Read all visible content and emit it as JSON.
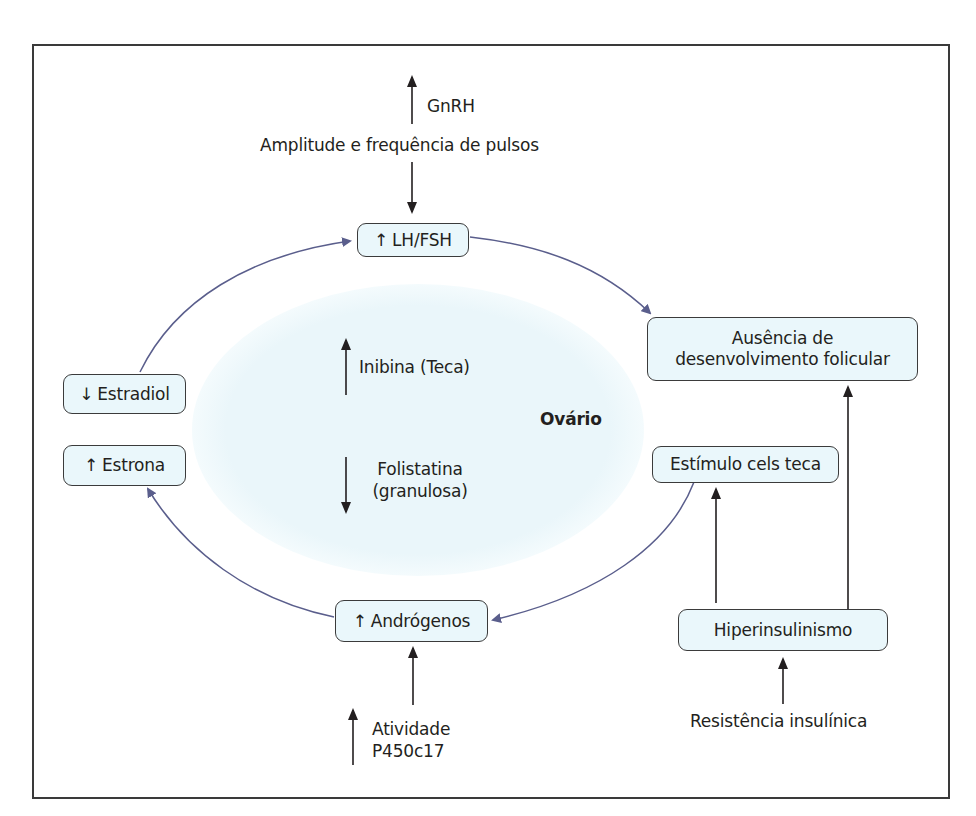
{
  "diagram": {
    "title_region": "Ovário",
    "colors": {
      "frame": "#3a3a3a",
      "node_fill": "#eaf7fb",
      "node_border": "#3b3b3b",
      "ovary_fill": "#eaf6fa",
      "cycle_arrow": "#5a5e8c",
      "black_arrow": "#231f20",
      "text": "#231f20"
    },
    "top": {
      "gnrh_label": "GnRH",
      "gnrh_direction": "up",
      "pulses_label": "Amplitude e frequência de pulsos"
    },
    "nodes": {
      "lh_fsh": {
        "icon": "up-arrow",
        "glyph": "↑",
        "label": "LH/FSH"
      },
      "estradiol": {
        "icon": "down-arrow",
        "glyph": "↓",
        "label": "Estradiol"
      },
      "estrona": {
        "icon": "up-arrow",
        "glyph": "↑",
        "label": "Estrona"
      },
      "ausencia": {
        "line1": "Ausência de",
        "line2": "desenvolvimento folicular"
      },
      "estimulo": {
        "label": "Estímulo cels teca"
      },
      "androgenos": {
        "icon": "up-arrow",
        "glyph": "↑",
        "label": "Andrógenos"
      },
      "hiperinsulinismo": {
        "label": "Hiperinsulinismo"
      }
    },
    "ovary": {
      "label": "Ovário",
      "inibina": {
        "direction": "up",
        "label": "Inibina (Teca)"
      },
      "folistatina": {
        "direction": "down",
        "line1": "Folistatina",
        "line2": "(granulosa)"
      }
    },
    "bottom": {
      "atividade": {
        "direction": "up",
        "line1": "Atividade",
        "line2": "P450c17"
      },
      "resistencia": "Resistência insulínica"
    },
    "edges": [
      {
        "from": "Amplitude e frequência de pulsos",
        "to": "LH/FSH",
        "style": "black"
      },
      {
        "from": "LH/FSH",
        "to": "Ausência de desenvolvimento folicular",
        "style": "cycle"
      },
      {
        "from": "Estímulo cels teca",
        "to": "Andrógenos",
        "style": "cycle"
      },
      {
        "from": "Andrógenos",
        "to": "Estrona",
        "style": "cycle"
      },
      {
        "from": "Estradiol",
        "to": "LH/FSH",
        "style": "cycle"
      },
      {
        "from": "Atividade P450c17",
        "to": "Andrógenos",
        "style": "black"
      },
      {
        "from": "Hiperinsulinismo",
        "to": "Estímulo cels teca",
        "style": "black"
      },
      {
        "from": "Hiperinsulinismo",
        "to": "Ausência de desenvolvimento folicular",
        "style": "black"
      },
      {
        "from": "Resistência insulínica",
        "to": "Hiperinsulinismo",
        "style": "black"
      }
    ]
  }
}
